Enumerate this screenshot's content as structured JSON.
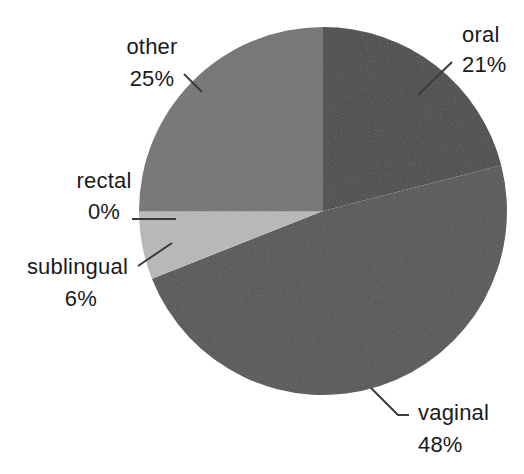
{
  "chart_data": {
    "type": "pie",
    "title": "",
    "subtitle": "",
    "xlabel": "",
    "ylabel": "",
    "legend_position": "none",
    "grid": false,
    "labels_show_percent": true,
    "start_angle_deg": 0,
    "direction": "clockwise",
    "categories": [
      "oral",
      "vaginal",
      "sublingual",
      "rectal",
      "other"
    ],
    "values": [
      21,
      48,
      6,
      0,
      25
    ],
    "slices": [
      {
        "name": "oral",
        "label": "oral",
        "percent_text": "21%",
        "value": 21,
        "color": "#4a4a4a",
        "start_deg": 0,
        "end_deg": 75.6,
        "label_x": 462,
        "label_y": 42,
        "value_x": 462,
        "value_y": 72,
        "label_anchor": "start",
        "leader": "M 418,95 L 452,62"
      },
      {
        "name": "vaginal",
        "label": "vaginal",
        "percent_text": "48%",
        "value": 48,
        "color": "#555555",
        "start_deg": 75.6,
        "end_deg": 248.4,
        "label_x": 418,
        "label_y": 420,
        "value_x": 418,
        "value_y": 452,
        "label_anchor": "start",
        "leader": "M 371,388 L 398,415 L 409,415"
      },
      {
        "name": "sublingual",
        "label": "sublingual",
        "percent_text": "6%",
        "value": 6,
        "color": "#b8b8b8",
        "start_deg": 248.4,
        "end_deg": 270.0,
        "label_x": 128,
        "label_y": 274,
        "value_x": 97,
        "value_y": 306,
        "label_anchor": "end",
        "leader": "M 138,266 L 172,243"
      },
      {
        "name": "rectal",
        "label": "rectal",
        "percent_text": "0%",
        "value": 0,
        "color": "#b8b8b8",
        "start_deg": 270.0,
        "end_deg": 270.0,
        "label_x": 104,
        "label_y": 188,
        "value_x": 104,
        "value_y": 219,
        "label_anchor": "mid",
        "leader": "M 132,219 L 176,219"
      },
      {
        "name": "other",
        "label": "other",
        "percent_text": "25%",
        "value": 25,
        "color": "#737373",
        "start_deg": 270.0,
        "end_deg": 360.0,
        "label_x": 152,
        "label_y": 54,
        "value_x": 152,
        "value_y": 86,
        "label_anchor": "mid",
        "leader": "M 184,74 L 202,92"
      }
    ],
    "geometry": {
      "center_x": 323,
      "center_y": 211,
      "radius": 184
    },
    "background_color": "#ffffff",
    "text_color": "#1a1a1a",
    "leader_color": "#3b3b3b"
  }
}
